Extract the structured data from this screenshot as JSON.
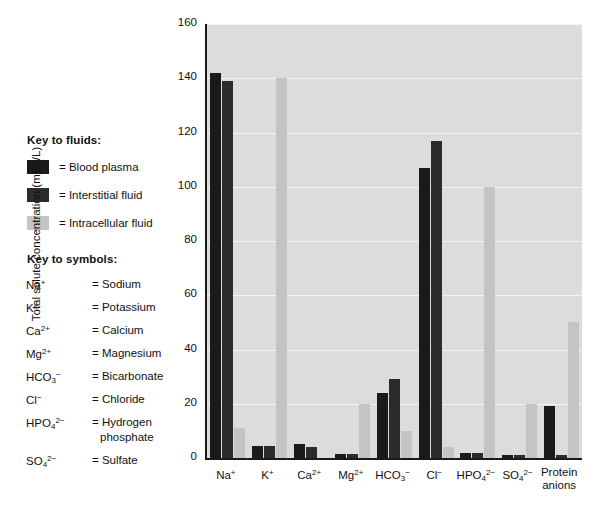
{
  "figure": {
    "background": "#ffffff",
    "plot_background": "#dcdcdc",
    "gridline_color": "#f5f5f5",
    "axis_color": "#1a1a1a"
  },
  "key_fluids": {
    "heading": "Key to fluids:",
    "items": [
      {
        "label": "= Blood plasma",
        "color": "#1a1a1a"
      },
      {
        "label": "= Interstitial fluid",
        "color": "#2b2b2b"
      },
      {
        "label": "= Intracellular fluid",
        "color": "#c4c4c4"
      }
    ]
  },
  "key_symbols": {
    "heading": "Key to symbols:",
    "items": [
      {
        "symbol_base": "Na",
        "symbol_sub": "",
        "symbol_sup": "+",
        "definition": "= Sodium"
      },
      {
        "symbol_base": "K",
        "symbol_sub": "",
        "symbol_sup": "+",
        "definition": "= Potassium"
      },
      {
        "symbol_base": "Ca",
        "symbol_sub": "",
        "symbol_sup": "2+",
        "definition": "= Calcium"
      },
      {
        "symbol_base": "Mg",
        "symbol_sub": "",
        "symbol_sup": "2+",
        "definition": "= Magnesium"
      },
      {
        "symbol_base": "HCO",
        "symbol_sub": "3",
        "symbol_sup": "−",
        "definition": "= Bicarbonate"
      },
      {
        "symbol_base": "Cl",
        "symbol_sub": "",
        "symbol_sup": "−",
        "definition": "= Chloride"
      },
      {
        "symbol_base": "HPO",
        "symbol_sub": "4",
        "symbol_sup": "2−",
        "definition": "= Hydrogen",
        "definition_line2": "phosphate"
      },
      {
        "symbol_base": "SO",
        "symbol_sub": "4",
        "symbol_sup": "2−",
        "definition": "= Sulfate"
      }
    ]
  },
  "chart_data": {
    "type": "bar",
    "title": "",
    "xlabel": "",
    "ylabel": "Total solute concentration (mEq/L)",
    "ylim": [
      0,
      160
    ],
    "yticks": [
      0,
      20,
      40,
      60,
      80,
      100,
      120,
      140,
      160
    ],
    "grid": true,
    "legend_position": "left-outside",
    "categories": [
      {
        "base": "Na",
        "sub": "",
        "sup": "+",
        "line2": ""
      },
      {
        "base": "K",
        "sub": "",
        "sup": "+",
        "line2": ""
      },
      {
        "base": "Ca",
        "sub": "",
        "sup": "2+",
        "line2": ""
      },
      {
        "base": "Mg",
        "sub": "",
        "sup": "2+",
        "line2": ""
      },
      {
        "base": "HCO",
        "sub": "3",
        "sup": "−",
        "line2": ""
      },
      {
        "base": "Cl",
        "sub": "",
        "sup": "−",
        "line2": ""
      },
      {
        "base": "HPO",
        "sub": "4",
        "sup": "2−",
        "line2": ""
      },
      {
        "base": "SO",
        "sub": "4",
        "sup": "2−",
        "line2": ""
      },
      {
        "base": "Protein",
        "sub": "",
        "sup": "",
        "line2": "anions"
      }
    ],
    "series": [
      {
        "name": "Blood plasma",
        "color": "#1a1a1a",
        "values": [
          142,
          4.5,
          5,
          1.5,
          24,
          107,
          2,
          1,
          19
        ]
      },
      {
        "name": "Interstitial fluid",
        "color": "#2b2b2b",
        "values": [
          139,
          4.3,
          4,
          1.5,
          29,
          117,
          2,
          1,
          1
        ]
      },
      {
        "name": "Intracellular fluid",
        "color": "#c4c4c4",
        "values": [
          11,
          140,
          0,
          20,
          10,
          4,
          100,
          20,
          50
        ]
      }
    ]
  }
}
